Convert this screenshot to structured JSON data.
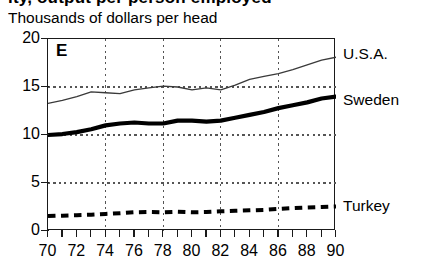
{
  "figure": {
    "title_partial": "ity, output per person employed",
    "subtitle": "Thousands of dollars per head",
    "panel_letter": "E"
  },
  "axes": {
    "y_ticks": [
      "0",
      "5",
      "10",
      "15",
      "20"
    ],
    "x_ticks": [
      "70",
      "72",
      "74",
      "76",
      "78",
      "80",
      "82",
      "84",
      "86",
      "88",
      "90"
    ]
  },
  "series_labels": {
    "usa": "U.S.A.",
    "sweden": "Sweden",
    "turkey": "Turkey"
  },
  "chart_data": {
    "type": "line",
    "title": "Thousands of dollars per head",
    "subtitle": "Thousands of dollars per head",
    "panel_letter": "E",
    "xlabel": "",
    "ylabel": "Thousands of dollars per head",
    "xlim": [
      70,
      90
    ],
    "ylim": [
      0,
      20
    ],
    "x_tick_values": [
      70,
      72,
      74,
      76,
      78,
      80,
      82,
      84,
      86,
      88,
      90
    ],
    "y_tick_values": [
      0,
      5,
      10,
      15,
      20
    ],
    "x_minor_tick_step": 1,
    "grid": "dotted gridlines: horizontal at y=5,10,15; vertical at x=74,78,82,86",
    "legend_position": "right-of-plot, inline with each line end",
    "x": [
      70,
      71,
      72,
      73,
      74,
      75,
      76,
      77,
      78,
      79,
      80,
      81,
      82,
      83,
      84,
      85,
      86,
      87,
      88,
      89,
      90
    ],
    "series": [
      {
        "name": "U.S.A.",
        "style": "thin solid",
        "values": [
          13.3,
          13.6,
          14.0,
          14.5,
          14.4,
          14.3,
          14.7,
          14.9,
          15.1,
          15.0,
          14.7,
          14.9,
          14.7,
          15.2,
          15.8,
          16.1,
          16.4,
          16.8,
          17.3,
          17.8,
          18.1
        ]
      },
      {
        "name": "Sweden",
        "style": "thick solid",
        "values": [
          10.0,
          10.1,
          10.3,
          10.6,
          11.0,
          11.2,
          11.3,
          11.2,
          11.2,
          11.5,
          11.5,
          11.4,
          11.5,
          11.8,
          12.1,
          12.4,
          12.8,
          13.1,
          13.4,
          13.8,
          14.0
        ]
      },
      {
        "name": "Turkey",
        "style": "bold dashed",
        "values": [
          1.55,
          1.6,
          1.65,
          1.7,
          1.78,
          1.85,
          1.95,
          1.98,
          1.95,
          2.0,
          1.95,
          1.98,
          2.05,
          2.1,
          2.15,
          2.2,
          2.3,
          2.38,
          2.45,
          2.5,
          2.55
        ]
      }
    ]
  }
}
